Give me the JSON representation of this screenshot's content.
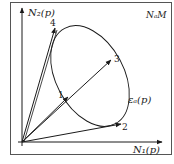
{
  "diagram": {
    "frame_label": "NₐM",
    "axes": {
      "x_label": "N₁(p)",
      "y_label": "N₂(p)"
    },
    "curve_label": "εₐ(p)",
    "points": [
      {
        "id": "1",
        "label": "1"
      },
      {
        "id": "2",
        "label": "2"
      },
      {
        "id": "3",
        "label": "3"
      },
      {
        "id": "4",
        "label": "4"
      }
    ],
    "colors": {
      "line": "#1a1a1a",
      "frame": "#555555",
      "background": "#ffffff"
    }
  }
}
